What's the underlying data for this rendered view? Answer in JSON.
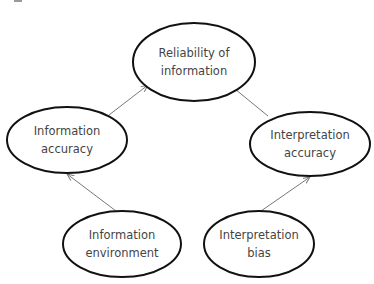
{
  "diagram": {
    "type": "flow",
    "nodes": [
      {
        "id": "reliability",
        "lines": [
          "Reliability of",
          "information"
        ],
        "cx": 194,
        "cy": 62,
        "rx": 61,
        "ry": 39
      },
      {
        "id": "info_accuracy",
        "lines": [
          "Information",
          "accuracy"
        ],
        "cx": 67,
        "cy": 140,
        "rx": 60,
        "ry": 33
      },
      {
        "id": "interp_accuracy",
        "lines": [
          "Interpretation",
          "accuracy"
        ],
        "cx": 310,
        "cy": 144,
        "rx": 60,
        "ry": 32
      },
      {
        "id": "info_environment",
        "lines": [
          "Information",
          "environment"
        ],
        "cx": 122,
        "cy": 244,
        "rx": 59,
        "ry": 33
      },
      {
        "id": "interp_bias",
        "lines": [
          "Interpretation",
          "bias"
        ],
        "cx": 259,
        "cy": 244,
        "rx": 55,
        "ry": 33
      }
    ],
    "edges": [
      {
        "from": "info_accuracy",
        "to": "reliability",
        "x1": 109,
        "y1": 115,
        "x2": 148,
        "y2": 85
      },
      {
        "from": "interp_accuracy",
        "to": "reliability",
        "x1": 268,
        "y1": 116,
        "x2": 230,
        "y2": 85
      },
      {
        "from": "info_environment",
        "to": "info_accuracy",
        "x1": 116,
        "y1": 211,
        "x2": 67,
        "y2": 174
      },
      {
        "from": "interp_bias",
        "to": "interp_accuracy",
        "x1": 261,
        "y1": 211,
        "x2": 310,
        "y2": 177
      }
    ],
    "colors": {
      "node_stroke": "#111111",
      "edge": "#777777",
      "text": "#444444"
    }
  }
}
